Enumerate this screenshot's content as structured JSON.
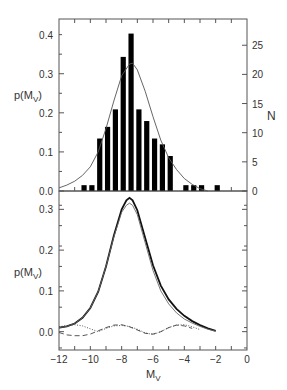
{
  "chart_data": [
    {
      "panel": "top",
      "type": "bar",
      "title": "",
      "xlabel": "",
      "ylabel": "p(M_V)",
      "ylabel_main": "p(M",
      "ylabel_sub": "V",
      "ylabel_close": ")",
      "y2label": "N",
      "xlim": [
        -12,
        0
      ],
      "ylim": [
        0,
        0.44
      ],
      "y2lim": [
        0,
        29.5
      ],
      "yticks": [
        "0.0",
        "0.1",
        "0.2",
        "0.3",
        "0.4"
      ],
      "ytick_values": [
        0,
        0.1,
        0.2,
        0.3,
        0.4
      ],
      "y2ticks": [
        "0",
        "5",
        "10",
        "15",
        "20",
        "25"
      ],
      "y2tick_values": [
        0,
        5,
        10,
        15,
        20,
        25
      ],
      "grid": false,
      "series": [
        {
          "name": "Histogram N",
          "kind": "bar",
          "axis": "right",
          "color": "#000000",
          "x": [
            -10.4,
            -9.9,
            -9.4,
            -8.9,
            -8.4,
            -7.9,
            -7.4,
            -6.9,
            -6.4,
            -5.9,
            -5.4,
            -4.9,
            -3.9,
            -3.4,
            -2.9,
            -1.9
          ],
          "values": [
            1,
            1,
            9,
            11,
            14,
            23,
            27,
            14,
            12,
            9,
            8,
            6,
            1,
            1,
            1,
            1
          ]
        },
        {
          "name": "Fitted p(M_V)",
          "kind": "line",
          "axis": "left",
          "color": "#555555",
          "x": [
            -12,
            -11.5,
            -11,
            -10.5,
            -10,
            -9.5,
            -9,
            -8.5,
            -8,
            -7.5,
            -7.3,
            -7,
            -6.5,
            -6,
            -5.5,
            -5,
            -4.5,
            -4,
            -3.5,
            -3,
            -2.5
          ],
          "values": [
            0.008,
            0.015,
            0.025,
            0.04,
            0.062,
            0.1,
            0.16,
            0.23,
            0.295,
            0.325,
            0.327,
            0.31,
            0.255,
            0.19,
            0.13,
            0.085,
            0.055,
            0.032,
            0.017,
            0.006,
            0.0
          ]
        }
      ]
    },
    {
      "panel": "bottom",
      "type": "line",
      "title": "",
      "xlabel": "M_V",
      "xlabel_main": "M",
      "xlabel_sub": "V",
      "ylabel": "p(M_V)",
      "ylabel_main": "p(M",
      "ylabel_sub": "V",
      "ylabel_close": ")",
      "xlim": [
        -12,
        0
      ],
      "ylim": [
        -0.045,
        0.345
      ],
      "xticks": [
        "−12",
        "−10",
        "−8",
        "−6",
        "−4",
        "−2",
        "0"
      ],
      "xtick_values": [
        -12,
        -10,
        -8,
        -6,
        -4,
        -2,
        0
      ],
      "yticks": [
        "0.0",
        "0.1",
        "0.2",
        "0.3"
      ],
      "ytick_values": [
        0,
        0.1,
        0.2,
        0.3
      ],
      "grid": false,
      "series": [
        {
          "name": "Thick solid",
          "style": "solid-thick",
          "color": "#111111",
          "x": [
            -12,
            -11.5,
            -11,
            -10.5,
            -10,
            -9.5,
            -9,
            -8.5,
            -8,
            -7.7,
            -7.5,
            -7.3,
            -7,
            -6.5,
            -6,
            -5.5,
            -5,
            -4.5,
            -4,
            -3.5,
            -3,
            -2.5,
            -2
          ],
          "values": [
            0.01,
            0.013,
            0.02,
            0.034,
            0.058,
            0.098,
            0.16,
            0.235,
            0.3,
            0.322,
            0.328,
            0.322,
            0.298,
            0.23,
            0.163,
            0.113,
            0.079,
            0.056,
            0.039,
            0.026,
            0.016,
            0.008,
            0.002
          ]
        },
        {
          "name": "Thin solid",
          "style": "solid-thin",
          "color": "#666666",
          "x": [
            -12,
            -11.5,
            -11,
            -10.5,
            -10,
            -9.5,
            -9,
            -8.5,
            -8,
            -7.7,
            -7.5,
            -7.3,
            -7,
            -6.5,
            -6,
            -5.5,
            -5,
            -4.5,
            -4,
            -3.5,
            -3,
            -2.5,
            -2
          ],
          "values": [
            0.01,
            0.013,
            0.02,
            0.034,
            0.058,
            0.098,
            0.16,
            0.232,
            0.293,
            0.31,
            0.315,
            0.31,
            0.287,
            0.218,
            0.15,
            0.1,
            0.068,
            0.046,
            0.031,
            0.021,
            0.013,
            0.006,
            0.001
          ]
        },
        {
          "name": "Dotted",
          "style": "dotted",
          "color": "#444444",
          "x": [
            -12,
            -11.5,
            -11,
            -10.5,
            -10,
            -9.5,
            -9,
            -8.5,
            -8,
            -7.5,
            -7,
            -6.5,
            -6,
            -5.5,
            -5,
            -4.5,
            -4,
            -3.5,
            -3
          ],
          "values": [
            0.012,
            0.015,
            0.017,
            0.014,
            0.007,
            0.0,
            0.008,
            0.014,
            0.015,
            0.013,
            0.006,
            -0.003,
            -0.007,
            0.0,
            0.01,
            0.016,
            0.017,
            0.012,
            0.005
          ]
        },
        {
          "name": "Dashed",
          "style": "dashed",
          "color": "#444444",
          "x": [
            -12,
            -11.5,
            -11,
            -10.5,
            -10,
            -9.5,
            -9,
            -8.5,
            -8,
            -7.5,
            -7,
            -6.5,
            -6,
            -5.5,
            -5,
            -4.5,
            -4,
            -3.5
          ],
          "values": [
            -0.002,
            -0.008,
            -0.01,
            -0.01,
            -0.006,
            0.002,
            0.01,
            0.016,
            0.017,
            0.012,
            0.004,
            -0.004,
            -0.006,
            0.0,
            0.01,
            0.016,
            0.014,
            0.008
          ]
        }
      ]
    }
  ]
}
